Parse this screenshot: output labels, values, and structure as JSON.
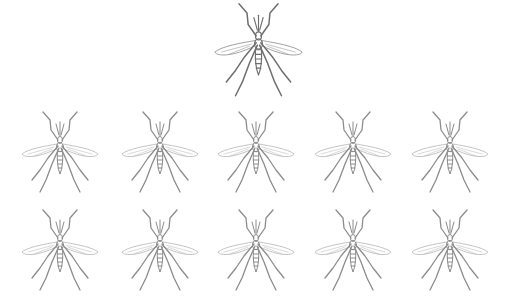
{
  "scene": {
    "description": "Mosquito illustrations: one featured mosquito on top, two rows of five below",
    "background": "#ffffff"
  },
  "featured": {
    "icon": "mosquito-icon",
    "cx": 258,
    "cy": 50,
    "scale": 1.15,
    "stroke": "#6e6e6e",
    "wing_stroke": "#9a9a9a"
  },
  "grid": {
    "rows": [
      {
        "cy": 152,
        "items": [
          {
            "cx": 60
          },
          {
            "cx": 160
          },
          {
            "cx": 256
          },
          {
            "cx": 353
          },
          {
            "cx": 450
          }
        ]
      },
      {
        "cy": 250,
        "items": [
          {
            "cx": 60
          },
          {
            "cx": 160
          },
          {
            "cx": 256
          },
          {
            "cx": 353
          },
          {
            "cx": 450
          }
        ]
      }
    ],
    "icon": "mosquito-icon",
    "scale": 1.0,
    "stroke": "#8c8c8c",
    "wing_stroke": "#b4b4b4"
  }
}
